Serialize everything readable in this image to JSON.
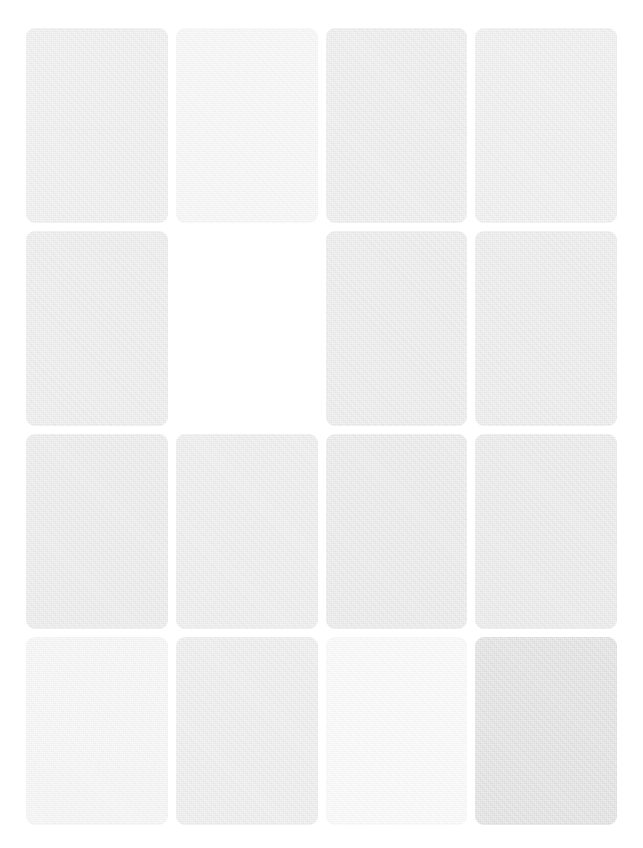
{
  "page": {
    "state": "loading",
    "background_color": "#ffffff",
    "width": 643,
    "height": 848
  },
  "grid": {
    "columns": 4,
    "rows": 4,
    "margin_left": 26,
    "margin_top": 28,
    "column_gap": 8,
    "row_gap": 8,
    "card_radius": 9,
    "row_height": 195,
    "last_row_height": 188
  },
  "palette": {
    "lightest": "#f7f7f7",
    "light": "#f2f2f2",
    "mid_light": "#ececec",
    "mid": "#e8e8e8",
    "mid_dark": "#e6e6e6",
    "darkest": "#dcdcdc",
    "background": "#ffffff"
  },
  "cards": [
    {
      "id": "card-r1c1",
      "row": 1,
      "col": 1,
      "filled": true,
      "color": "#ebebeb",
      "seam": true,
      "label": "placeholder-tile"
    },
    {
      "id": "card-r1c2",
      "row": 1,
      "col": 2,
      "filled": true,
      "color": "#f4f4f4",
      "seam": false,
      "label": "placeholder-tile"
    },
    {
      "id": "card-r1c3",
      "row": 1,
      "col": 3,
      "filled": true,
      "color": "#e9e9e9",
      "seam": true,
      "label": "placeholder-tile"
    },
    {
      "id": "card-r1c4",
      "row": 1,
      "col": 4,
      "filled": true,
      "color": "#ebebeb",
      "seam": true,
      "label": "placeholder-tile"
    },
    {
      "id": "card-r2c1",
      "row": 2,
      "col": 1,
      "filled": true,
      "color": "#e8e8e8",
      "seam": false,
      "label": "placeholder-tile"
    },
    {
      "id": "card-r2c2",
      "row": 2,
      "col": 2,
      "filled": false,
      "color": "#ffffff",
      "seam": false,
      "label": "empty-slot"
    },
    {
      "id": "card-r2c3",
      "row": 2,
      "col": 3,
      "filled": true,
      "color": "#e7e7e7",
      "seam": false,
      "label": "placeholder-tile"
    },
    {
      "id": "card-r2c4",
      "row": 2,
      "col": 4,
      "filled": true,
      "color": "#e7e7e7",
      "seam": false,
      "label": "placeholder-tile"
    },
    {
      "id": "card-r3c1",
      "row": 3,
      "col": 1,
      "filled": true,
      "color": "#e7e7e7",
      "seam": false,
      "label": "placeholder-tile"
    },
    {
      "id": "card-r3c2",
      "row": 3,
      "col": 2,
      "filled": true,
      "color": "#e9e9e9",
      "seam": false,
      "label": "placeholder-tile"
    },
    {
      "id": "card-r3c3",
      "row": 3,
      "col": 3,
      "filled": true,
      "color": "#e6e6e6",
      "seam": false,
      "label": "placeholder-tile"
    },
    {
      "id": "card-r3c4",
      "row": 3,
      "col": 4,
      "filled": true,
      "color": "#e6e6e6",
      "seam": false,
      "label": "placeholder-tile"
    },
    {
      "id": "card-r4c1",
      "row": 4,
      "col": 1,
      "filled": true,
      "color": "#f3f3f3",
      "seam": false,
      "label": "placeholder-tile"
    },
    {
      "id": "card-r4c2",
      "row": 4,
      "col": 2,
      "filled": true,
      "color": "#e9e9e9",
      "seam": false,
      "label": "placeholder-tile"
    },
    {
      "id": "card-r4c3",
      "row": 4,
      "col": 3,
      "filled": true,
      "color": "#f7f7f7",
      "seam": false,
      "label": "placeholder-tile"
    },
    {
      "id": "card-r4c4",
      "row": 4,
      "col": 4,
      "filled": true,
      "color": "#dcdcdc",
      "seam": false,
      "label": "placeholder-tile"
    }
  ]
}
